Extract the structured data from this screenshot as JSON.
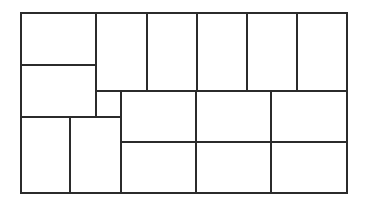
{
  "diagram": {
    "title": "",
    "stroke_color": "#2b2b2b",
    "background": "#ffffff",
    "stroke_width": 2,
    "outer": {
      "x": 21,
      "y": 13,
      "w": 326,
      "h": 180
    },
    "rects": [
      {
        "id": "r1",
        "x": 21,
        "y": 13,
        "w": 75,
        "h": 52
      },
      {
        "id": "r2",
        "x": 21,
        "y": 65,
        "w": 75,
        "h": 52
      },
      {
        "id": "r3",
        "x": 96,
        "y": 13,
        "w": 51,
        "h": 78
      },
      {
        "id": "r4",
        "x": 147,
        "y": 13,
        "w": 50,
        "h": 78
      },
      {
        "id": "r5",
        "x": 197,
        "y": 13,
        "w": 50,
        "h": 78
      },
      {
        "id": "r6",
        "x": 247,
        "y": 13,
        "w": 50,
        "h": 78
      },
      {
        "id": "r7",
        "x": 297,
        "y": 13,
        "w": 50,
        "h": 78
      },
      {
        "id": "r8",
        "x": 96,
        "y": 91,
        "w": 25,
        "h": 26
      },
      {
        "id": "r9",
        "x": 21,
        "y": 117,
        "w": 49,
        "h": 76
      },
      {
        "id": "r10",
        "x": 70,
        "y": 117,
        "w": 51,
        "h": 76
      },
      {
        "id": "r11",
        "x": 121,
        "y": 91,
        "w": 75,
        "h": 51
      },
      {
        "id": "r12",
        "x": 196,
        "y": 91,
        "w": 75,
        "h": 51
      },
      {
        "id": "r13",
        "x": 271,
        "y": 91,
        "w": 76,
        "h": 51
      },
      {
        "id": "r14",
        "x": 121,
        "y": 142,
        "w": 75,
        "h": 51
      },
      {
        "id": "r15",
        "x": 196,
        "y": 142,
        "w": 75,
        "h": 51
      },
      {
        "id": "r16",
        "x": 271,
        "y": 142,
        "w": 76,
        "h": 51
      }
    ]
  }
}
